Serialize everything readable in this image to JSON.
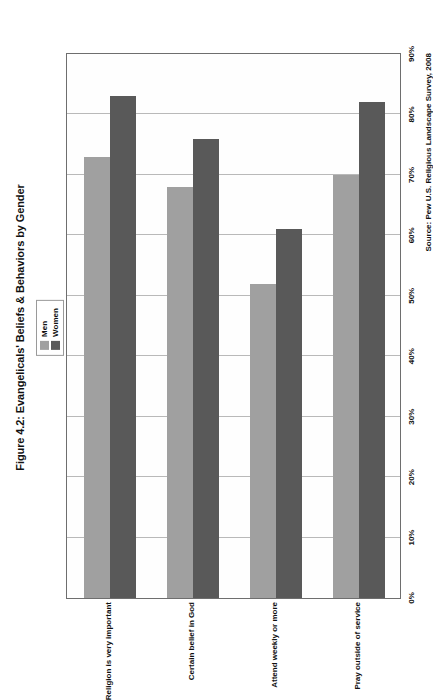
{
  "figure": {
    "title": "Figure 4.2: Evangelicals' Beliefs & Behaviors by Gender",
    "source": "Source: Pew U.S. Religious Landscape Survey, 2008",
    "orientation": "rotated-90"
  },
  "legend": {
    "position": "top-center",
    "entries": [
      {
        "label": "Men",
        "color": "#a0a0a0"
      },
      {
        "label": "Women",
        "color": "#595959"
      }
    ]
  },
  "axis": {
    "ticks": [
      "0%",
      "10%",
      "20%",
      "30%",
      "40%",
      "50%",
      "60%",
      "70%",
      "80%",
      "90%"
    ]
  },
  "chart_data": {
    "type": "bar",
    "title": "Figure 4.2: Evangelicals' Beliefs & Behaviors by Gender",
    "subtitle": "",
    "orientation": "horizontal",
    "categories": [
      "Religion is very important",
      "Certain belief in God",
      "Attend weekly or more",
      "Pray outside of service"
    ],
    "series": [
      {
        "name": "Men",
        "color": "#a0a0a0",
        "values": [
          73,
          68,
          52,
          70
        ]
      },
      {
        "name": "Women",
        "color": "#595959",
        "values": [
          83,
          76,
          61,
          82
        ]
      }
    ],
    "xlabel": "",
    "ylabel": "",
    "xlim": [
      0,
      90
    ],
    "tick_labels": [
      "0%",
      "10%",
      "20%",
      "30%",
      "40%",
      "50%",
      "60%",
      "70%",
      "80%",
      "90%"
    ],
    "tick_step": 10,
    "grid": true,
    "legend_position": "top-center",
    "annotations": [
      "Source: Pew U.S. Religious Landscape Survey, 2008"
    ]
  }
}
